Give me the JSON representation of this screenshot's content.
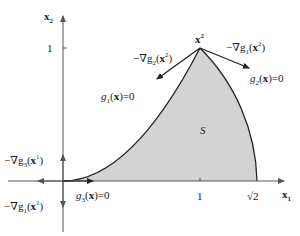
{
  "diagram": {
    "axes": {
      "x_label": "x",
      "x_label_sub": "1",
      "y_label": "x",
      "y_label_sub": "2",
      "x_ticks": [
        {
          "label": "1",
          "value": 1
        },
        {
          "label": "√2",
          "value": 1.4142
        }
      ],
      "y_ticks": [
        {
          "label": "1",
          "value": 1
        }
      ]
    },
    "region": {
      "label": "S",
      "fill": "#d3d3d3",
      "boundaries": [
        "g3(x)=0 : x2 = 0 (x-axis)",
        "g1(x)=0 : x2 = x1^2 (parabola)",
        "g2(x)=0 : x1^2 + x2^2 = 2 (circle)"
      ]
    },
    "points": [
      {
        "name": "x1",
        "label": "x",
        "sup": "1",
        "coords": [
          0,
          0
        ]
      },
      {
        "name": "x2",
        "label": "x",
        "sup": "2",
        "coords": [
          1,
          1
        ]
      }
    ],
    "labels": {
      "point_x2": {
        "main": "x",
        "sup": "2"
      },
      "neg_grad_g2_x2": {
        "prefix": "−∇g",
        "sub": "2",
        "arg_open": "(",
        "arg": "x",
        "sup": "2",
        "arg_close": ")"
      },
      "neg_grad_g1_x2": {
        "prefix": "−∇g",
        "sub": "1",
        "arg_open": "(",
        "arg": "x",
        "sup": "2",
        "arg_close": ")"
      },
      "g1_eq_zero": {
        "g": "g",
        "sub": "1",
        "rest_open": "(",
        "x": "x",
        "rest_close": ")=0"
      },
      "g2_eq_zero": {
        "g": "g",
        "sub": "2",
        "rest_open": "(",
        "x": "x",
        "rest_close": ")=0"
      },
      "g3_eq_zero": {
        "g": "g",
        "sub": "3",
        "rest_open": "(",
        "x": "x",
        "rest_close": ")=0"
      },
      "neg_grad_g3_x1": {
        "prefix": "−∇g",
        "sub": "3",
        "arg_open": "(",
        "arg": "x",
        "sup": "1",
        "arg_close": ")"
      },
      "neg_grad_g1_x1": {
        "prefix": "−∇g",
        "sub": "1",
        "arg_open": "(",
        "arg": "x",
        "sup": "1",
        "arg_close": ")"
      }
    },
    "colors": {
      "line": "#222222",
      "axis": "#555555",
      "region_fill": "#d3d3d3"
    }
  }
}
